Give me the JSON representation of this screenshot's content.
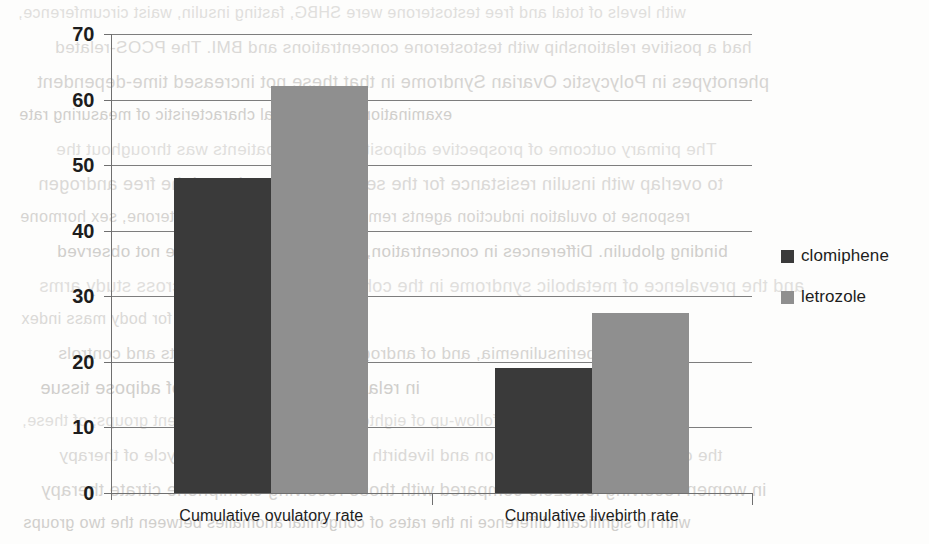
{
  "chart_data": {
    "type": "bar",
    "title": "",
    "xlabel": "",
    "ylabel": "",
    "ylim": [
      0,
      70
    ],
    "ytick_step": 10,
    "yticks": [
      70,
      60,
      50,
      40,
      30,
      20,
      10,
      0
    ],
    "grid": true,
    "legend_position": "right",
    "categories": [
      "Cumulative ovulatory rate",
      "Cumulative livebirth rate"
    ],
    "series": [
      {
        "name": "clomiphene",
        "color": "#3a3a3a",
        "values": [
          48,
          19
        ]
      },
      {
        "name": "letrozole",
        "color": "#8f8f8f",
        "values": [
          62,
          27.5
        ]
      }
    ]
  },
  "legend": {
    "items": [
      {
        "label": "clomiphene",
        "color": "#3a3a3a"
      },
      {
        "label": "letrozole",
        "color": "#8f8f8f"
      }
    ]
  },
  "axis": {
    "y_labels": [
      "70",
      "60",
      "50",
      "40",
      "30",
      "20",
      "10",
      "0"
    ]
  },
  "bleed_text": {
    "lines": [
      "with levels of total and free testosterone were SHBG, fasting insulin, waist circumference,",
      "had a positive relationship with testosterone concentrations and BMI. The PCOS-related",
      "phenotypes in Polycystic Ovarian Syndrome in that these not increased time-dependent",
      "examination is the clinical characteristic of measuring rate",
      "The primary outcome of prospective adiposity of PCOS patients was throughout the",
      "to overlap with insulin resistance for the serum leptin levels and the free androgen",
      "response to ovulation induction agents remained elevated free testosterone, sex hormone",
      "binding globulin. Differences in concentration, insulin and glucose were not observed",
      "and the prevalence of metabolic syndrome in the cohort was comparable across study arms",
      "after adjustment for body mass index",
      "hyperinsulinemia, and of androgen excess in the subjects and controls",
      "in relation to the distribution of adipose tissue",
      "and a mean duration of follow-up of eighteen months for the treatment groups; of these,",
      "the cumulative rate of ovulation and livebirth were recorded at each cycle of therapy",
      "in women receiving letrozole compared with those receiving clomiphene citrate therapy",
      "with no significant difference in the rates of congenital anomalies between the two groups"
    ]
  }
}
